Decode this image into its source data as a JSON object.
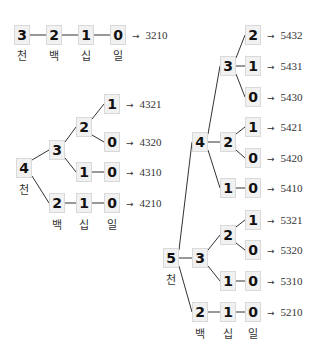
{
  "colors": {
    "box_fill": "#f1f1f1",
    "box_border": "#d9d9d9",
    "line": "#333333",
    "text": "#111111"
  },
  "place_labels": [
    "천",
    "백",
    "십",
    "일"
  ],
  "arrow_glyph": "→",
  "nodes": [
    {
      "id": "t0",
      "v": "3",
      "x": 22,
      "y": 35
    },
    {
      "id": "t1",
      "v": "2",
      "x": 54,
      "y": 35
    },
    {
      "id": "t2",
      "v": "1",
      "x": 86,
      "y": 35
    },
    {
      "id": "t3",
      "v": "0",
      "x": 118,
      "y": 35
    },
    {
      "id": "a4",
      "v": "4",
      "x": 24,
      "y": 168
    },
    {
      "id": "a3",
      "v": "3",
      "x": 57,
      "y": 150
    },
    {
      "id": "a32",
      "v": "2",
      "x": 84,
      "y": 127
    },
    {
      "id": "a321",
      "v": "1",
      "x": 112,
      "y": 104
    },
    {
      "id": "a320",
      "v": "0",
      "x": 112,
      "y": 142
    },
    {
      "id": "a31",
      "v": "1",
      "x": 84,
      "y": 172
    },
    {
      "id": "a310",
      "v": "0",
      "x": 112,
      "y": 172
    },
    {
      "id": "a2",
      "v": "2",
      "x": 57,
      "y": 203
    },
    {
      "id": "a21",
      "v": "1",
      "x": 84,
      "y": 203
    },
    {
      "id": "a210",
      "v": "0",
      "x": 112,
      "y": 203
    },
    {
      "id": "b5",
      "v": "5",
      "x": 171,
      "y": 258
    },
    {
      "id": "b4",
      "v": "4",
      "x": 200,
      "y": 142
    },
    {
      "id": "b43",
      "v": "3",
      "x": 228,
      "y": 66
    },
    {
      "id": "b432",
      "v": "2",
      "x": 253,
      "y": 35
    },
    {
      "id": "b431",
      "v": "1",
      "x": 253,
      "y": 66
    },
    {
      "id": "b430",
      "v": "0",
      "x": 253,
      "y": 97
    },
    {
      "id": "b42",
      "v": "2",
      "x": 228,
      "y": 142
    },
    {
      "id": "b421",
      "v": "1",
      "x": 253,
      "y": 127
    },
    {
      "id": "b420",
      "v": "0",
      "x": 253,
      "y": 158
    },
    {
      "id": "b41",
      "v": "1",
      "x": 228,
      "y": 188
    },
    {
      "id": "b410",
      "v": "0",
      "x": 253,
      "y": 188
    },
    {
      "id": "b3",
      "v": "3",
      "x": 200,
      "y": 258
    },
    {
      "id": "b32",
      "v": "2",
      "x": 228,
      "y": 235
    },
    {
      "id": "b321",
      "v": "1",
      "x": 253,
      "y": 220
    },
    {
      "id": "b320",
      "v": "0",
      "x": 253,
      "y": 250
    },
    {
      "id": "b31",
      "v": "1",
      "x": 228,
      "y": 281
    },
    {
      "id": "b310",
      "v": "0",
      "x": 253,
      "y": 281
    },
    {
      "id": "b2",
      "v": "2",
      "x": 200,
      "y": 312
    },
    {
      "id": "b21",
      "v": "1",
      "x": 228,
      "y": 312
    },
    {
      "id": "b210",
      "v": "0",
      "x": 253,
      "y": 312
    }
  ],
  "edges": [
    [
      "t0",
      "t1"
    ],
    [
      "t1",
      "t2"
    ],
    [
      "t2",
      "t3"
    ],
    [
      "a4",
      "a3"
    ],
    [
      "a3",
      "a32"
    ],
    [
      "a32",
      "a321"
    ],
    [
      "a32",
      "a320"
    ],
    [
      "a3",
      "a31"
    ],
    [
      "a31",
      "a310"
    ],
    [
      "a4",
      "a2"
    ],
    [
      "a2",
      "a21"
    ],
    [
      "a21",
      "a210"
    ],
    [
      "b5",
      "b4"
    ],
    [
      "b4",
      "b43"
    ],
    [
      "b43",
      "b432"
    ],
    [
      "b43",
      "b431"
    ],
    [
      "b43",
      "b430"
    ],
    [
      "b4",
      "b42"
    ],
    [
      "b42",
      "b421"
    ],
    [
      "b42",
      "b420"
    ],
    [
      "b4",
      "b41"
    ],
    [
      "b41",
      "b410"
    ],
    [
      "b5",
      "b3"
    ],
    [
      "b3",
      "b32"
    ],
    [
      "b32",
      "b321"
    ],
    [
      "b32",
      "b320"
    ],
    [
      "b3",
      "b31"
    ],
    [
      "b31",
      "b310"
    ],
    [
      "b5",
      "b2"
    ],
    [
      "b2",
      "b21"
    ],
    [
      "b21",
      "b210"
    ]
  ],
  "results": [
    {
      "from": "t3",
      "text": "3210"
    },
    {
      "from": "a321",
      "text": "4321"
    },
    {
      "from": "a320",
      "text": "4320"
    },
    {
      "from": "a310",
      "text": "4310"
    },
    {
      "from": "a210",
      "text": "4210"
    },
    {
      "from": "b432",
      "text": "5432"
    },
    {
      "from": "b431",
      "text": "5431"
    },
    {
      "from": "b430",
      "text": "5430"
    },
    {
      "from": "b421",
      "text": "5421"
    },
    {
      "from": "b420",
      "text": "5420"
    },
    {
      "from": "b410",
      "text": "5410"
    },
    {
      "from": "b321",
      "text": "5321"
    },
    {
      "from": "b320",
      "text": "5320"
    },
    {
      "from": "b310",
      "text": "5310"
    },
    {
      "from": "b210",
      "text": "5210"
    }
  ],
  "labels": [
    {
      "text": "천",
      "x": 22,
      "y": 55
    },
    {
      "text": "백",
      "x": 54,
      "y": 55
    },
    {
      "text": "십",
      "x": 86,
      "y": 55
    },
    {
      "text": "일",
      "x": 118,
      "y": 55
    },
    {
      "text": "천",
      "x": 24,
      "y": 189
    },
    {
      "text": "백",
      "x": 57,
      "y": 224
    },
    {
      "text": "십",
      "x": 84,
      "y": 224
    },
    {
      "text": "일",
      "x": 112,
      "y": 224
    },
    {
      "text": "천",
      "x": 171,
      "y": 279
    },
    {
      "text": "백",
      "x": 200,
      "y": 333
    },
    {
      "text": "십",
      "x": 228,
      "y": 333
    },
    {
      "text": "일",
      "x": 253,
      "y": 333
    }
  ]
}
